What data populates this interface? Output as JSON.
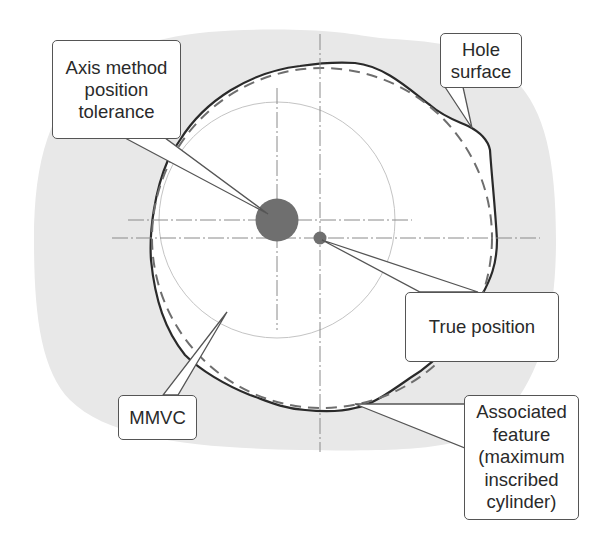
{
  "colors": {
    "background": "#ffffff",
    "material_gray": "#e8e8e8",
    "hole_interior": "#ffffff",
    "outline": "#2a2a2a",
    "dashed": "#6e6e6e",
    "centerline": "#8a8a8a",
    "mmvc_circle": "#c4c4c4",
    "tolerance_zone": "#6f6f6f",
    "true_position_dot": "#6f6f6f",
    "callout_border": "#555555",
    "text": "#2a2a2a"
  },
  "labels": {
    "axis_method": "Axis method\nposition\ntolerance",
    "hole_surface": "Hole\nsurface",
    "true_position": "True position",
    "mmvc": "MMVC",
    "associated_feature": "Associated\nfeature\n(maximum\ninscribed\ncylinder)"
  },
  "legend_items": [
    {
      "id": "axis_method",
      "points_to": "tolerance zone (large filled circle)"
    },
    {
      "id": "hole_surface",
      "points_to": "solid irregular outline"
    },
    {
      "id": "true_position",
      "points_to": "small filled dot"
    },
    {
      "id": "mmvc",
      "points_to": "thin inner circle"
    },
    {
      "id": "associated_feature",
      "points_to": "dashed circle"
    }
  ]
}
